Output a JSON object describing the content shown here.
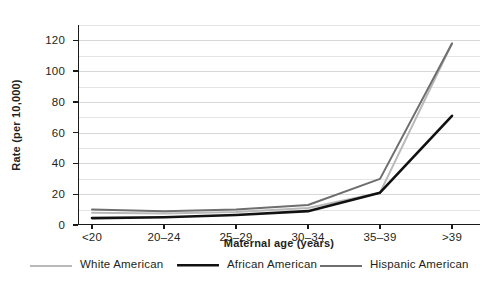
{
  "chart_data": {
    "type": "line",
    "title": "",
    "subtitle": "",
    "xlabel": "Maternal age (years)",
    "ylabel": "Rate (per 10,000)",
    "categories": [
      "<20",
      "20–24",
      "25–29",
      "30–34",
      "35–39",
      ">39"
    ],
    "ylim": [
      0,
      130
    ],
    "yticks": [
      0,
      20,
      40,
      60,
      80,
      100,
      120
    ],
    "ytick_labels": [
      "0",
      "20",
      "40",
      "60",
      "80",
      "100",
      "120"
    ],
    "grid": "horizontal gridlines every 10 units",
    "legend_position": "below plot, horizontal",
    "series": [
      {
        "name": "White American",
        "color": "#b9b9b9",
        "width": 2.0,
        "values": [
          8,
          7.5,
          8.5,
          11,
          21,
          118
        ]
      },
      {
        "name": "African American",
        "color": "#111111",
        "width": 2.6,
        "values": [
          4.5,
          5,
          6.5,
          9,
          21,
          71
        ]
      },
      {
        "name": "Hispanic American",
        "color": "#6e6e6e",
        "width": 2.0,
        "values": [
          10,
          9,
          10,
          13,
          30,
          118
        ]
      }
    ]
  },
  "legend": {
    "items": [
      {
        "label": "White American"
      },
      {
        "label": "African American"
      },
      {
        "label": "Hispanic American"
      }
    ]
  }
}
